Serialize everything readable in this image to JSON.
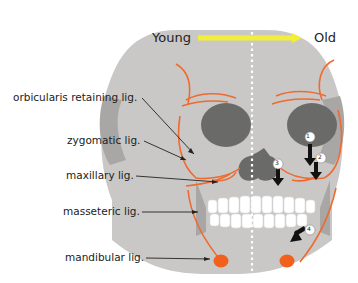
{
  "title_axis": {
    "left_label": "Young",
    "right_label": "Old",
    "arrow_color": "#f2ef3a"
  },
  "ligaments": [
    {
      "label": "orbicularis retaining  lig."
    },
    {
      "label": "zygomatic lig."
    },
    {
      "label": "maxillary lig."
    },
    {
      "label": "masseteric lig."
    },
    {
      "label": "mandibular lig."
    }
  ],
  "markers": [
    {
      "number": "①",
      "text": "1"
    },
    {
      "number": "②",
      "text": "2"
    },
    {
      "number": "③",
      "text": "3"
    },
    {
      "number": "④",
      "text": "4"
    }
  ],
  "colors": {
    "skull": "#c9c8c6",
    "orbit": "#6a6a68",
    "ligament": "#ef6a2f",
    "node": "#f2601e",
    "arrow": "#111111"
  }
}
